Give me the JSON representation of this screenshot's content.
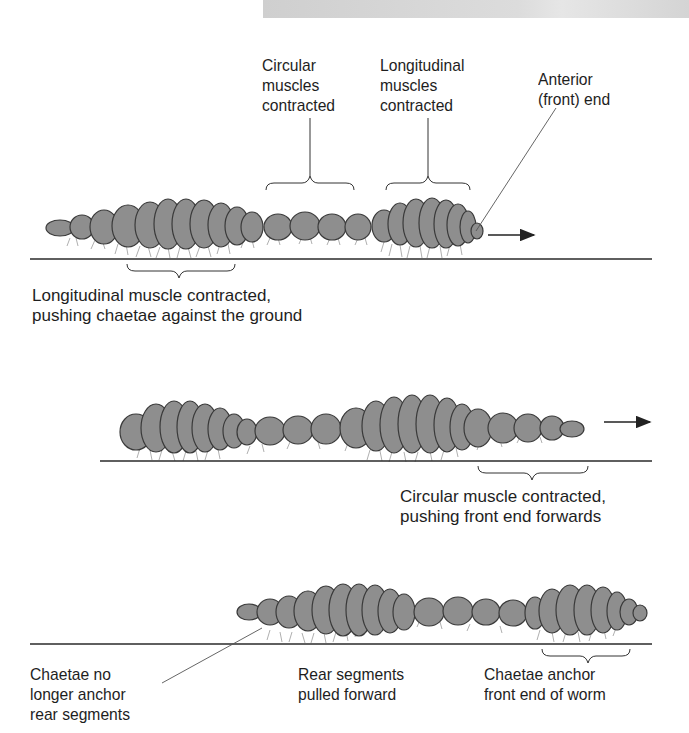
{
  "figure": {
    "colors": {
      "worm_fill": "#8e8e8e",
      "worm_outline": "#3a3a3a",
      "ground_line": "#2a2a2a",
      "top_bar": "#d6d6d6",
      "text": "#1e1e1e"
    }
  },
  "stage1": {
    "label_circular": "Circular\nmuscles\ncontracted",
    "label_longitudinal": "Longitudinal\nmuscles\ncontracted",
    "label_anterior": "Anterior\n(front) end",
    "label_ground": "Longitudinal muscle contracted,\npushing chaetae against the ground",
    "direction_arrow": "right-arrow"
  },
  "stage2": {
    "label_circular": "Circular muscle contracted,\npushing front end forwards",
    "direction_arrow": "right-arrow"
  },
  "stage3": {
    "label_rear_anchor": "Chaetae no\nlonger anchor\nrear segments",
    "label_rear_pulled": "Rear segments\npulled forward",
    "label_front_anchor": "Chaetae anchor\nfront end of worm"
  }
}
